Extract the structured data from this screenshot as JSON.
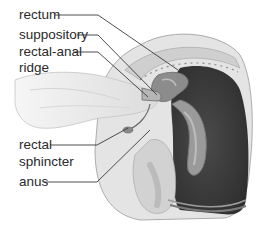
{
  "diagram": {
    "type": "anatomical illustration",
    "colors": {
      "background": "#ffffff",
      "label_text": "#2a2a2a",
      "leader_line": "#3a3a3a",
      "rectum_cavity": "#3a3a3a",
      "tissue": "#d8d8d8",
      "skin": "#eeeeee"
    },
    "labels": [
      {
        "id": "rectum",
        "text": "rectum"
      },
      {
        "id": "suppository",
        "text": "suppository"
      },
      {
        "id": "rectal-anal-ridge",
        "line1": "rectal-anal",
        "line2": "ridge"
      },
      {
        "id": "rectal-sphincter",
        "line1": "rectal",
        "line2": "sphincter"
      },
      {
        "id": "anus",
        "text": "anus"
      }
    ]
  }
}
